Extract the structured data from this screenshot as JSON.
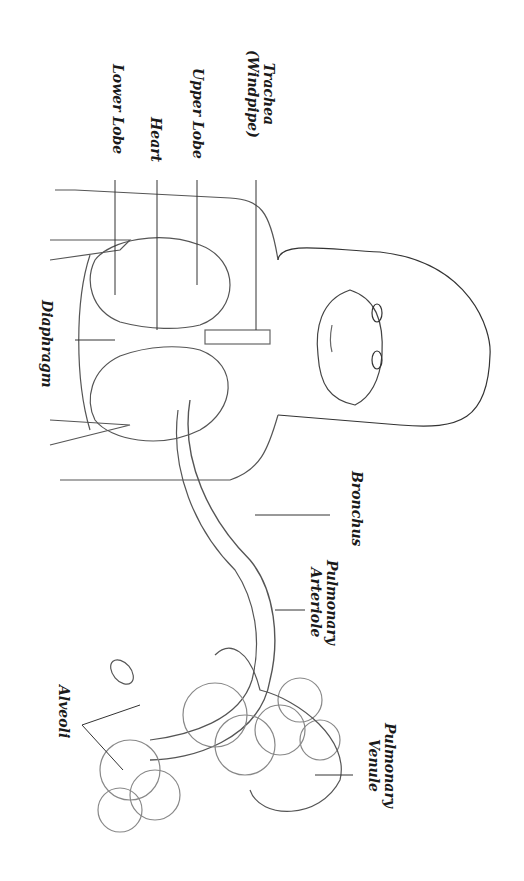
{
  "diagram": {
    "orientation": "rotated 90 degrees clockwise",
    "labels": {
      "trachea": [
        "Trachea",
        "(Windpipe)"
      ],
      "upper_lobe": "Upper Lobe",
      "heart": "Heart",
      "lower_lobe": "Lower Lobe",
      "diaphragm": "Diaphragm",
      "bronchus": "Bronchus",
      "pulmonary_arteriole": [
        "Pulmonary",
        "Arteriole"
      ],
      "pulmonary_venule": [
        "Pulmonary",
        "Venule"
      ],
      "alveoli": "Alveoli"
    },
    "colors": {
      "line": "#555555",
      "text": "#1a1a1a",
      "background": "#ffffff"
    }
  }
}
